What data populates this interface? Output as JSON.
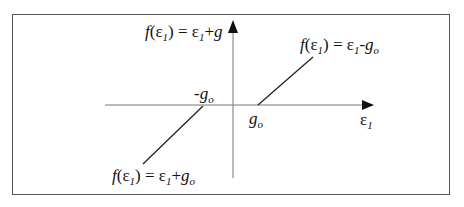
{
  "diagram": {
    "type": "piecewise-linear transfer function",
    "axes": {
      "x_label": "ε1",
      "y_label_top": "f(ε1) = ε1+g"
    },
    "ticks": {
      "negative": "-go",
      "positive": "go"
    },
    "segments": [
      {
        "label": "f(ε1) = ε1-go",
        "region": "ε1 > go"
      },
      {
        "label": "f(ε1) = ε1+go",
        "region": "ε1 < -go"
      }
    ],
    "colors": {
      "line": "#222222",
      "axis": "#666666",
      "border": "#555555"
    }
  }
}
